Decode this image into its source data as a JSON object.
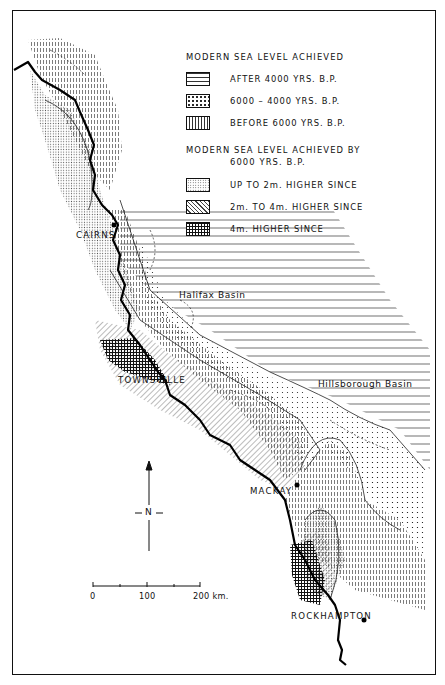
{
  "legend": {
    "group1": {
      "heading": "MODERN SEA LEVEL ACHIEVED",
      "items": [
        {
          "label": "AFTER 4000 YRS. B.P.",
          "pattern": "horizontal-lines"
        },
        {
          "label": "6000 – 4000 YRS. B.P.",
          "pattern": "sparse-dots"
        },
        {
          "label": "BEFORE 6000 YRS. B.P.",
          "pattern": "vertical-dashes"
        }
      ]
    },
    "group2": {
      "heading": "MODERN SEA LEVEL ACHIEVED BY",
      "heading_line2": "6000 YRS. B.P.",
      "items": [
        {
          "label": "UP TO 2m. HIGHER SINCE",
          "pattern": "fine-stipple"
        },
        {
          "label": "2m. TO 4m. HIGHER SINCE",
          "pattern": "diagonal-hatch"
        },
        {
          "label": "4m. HIGHER SINCE",
          "pattern": "cross-hatch"
        }
      ]
    }
  },
  "places": {
    "cairns": "CAIRNS",
    "townsville": "TOWNSVILLE",
    "mackay": "MACKAY",
    "rockhampton": "ROCKHAMPTON"
  },
  "basins": {
    "halifax": "Halifax Basin",
    "hillsborough": "Hillsborough Basin"
  },
  "north_arrow": {
    "label": "N"
  },
  "scale_bar": {
    "ticks": [
      "0",
      "100",
      "200 km."
    ],
    "max_km": 200
  },
  "colors": {
    "ink": "#111111",
    "paper": "#ffffff"
  }
}
